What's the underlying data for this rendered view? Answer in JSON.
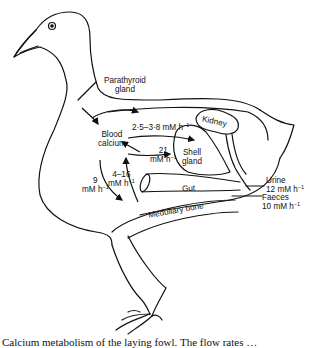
{
  "diagram": {
    "labels": {
      "parathyroid": [
        "Parathyroid",
        "gland"
      ],
      "blood_calcium": [
        "Blood",
        "calcium"
      ],
      "kidney": "Kidney",
      "shell_gland": [
        "Shell",
        "gland"
      ],
      "gut": "Gut",
      "medullary_bone": "Medullary bone",
      "urine": "Urine",
      "faeces": "Faeces"
    },
    "rates": {
      "to_kidney": "2·5–3·8 mM h",
      "to_shell_gland": [
        "21",
        "mM h"
      ],
      "medullary_exchange": [
        "4–16",
        "mM h"
      ],
      "to_medullary": [
        "9",
        "mM h"
      ],
      "urine": "12 mM h",
      "faeces": "10 mM h"
    },
    "unit_exponent": "−1"
  },
  "caption": "Calcium metabolism of the laying fowl. The flow rates …"
}
